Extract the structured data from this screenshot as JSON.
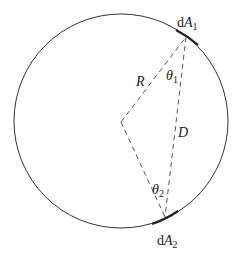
{
  "diagram": {
    "labels": {
      "element1_prefix": "d",
      "element1_var": "A",
      "element1_sub": "1",
      "element2_prefix": "d",
      "element2_var": "A",
      "element2_sub": "2",
      "radius": "R",
      "chord": "D",
      "angle1_var": "θ",
      "angle1_sub": "1",
      "angle2_var": "θ",
      "angle2_sub": "2"
    },
    "colors": {
      "stroke": "#333333",
      "text": "#222222"
    }
  }
}
